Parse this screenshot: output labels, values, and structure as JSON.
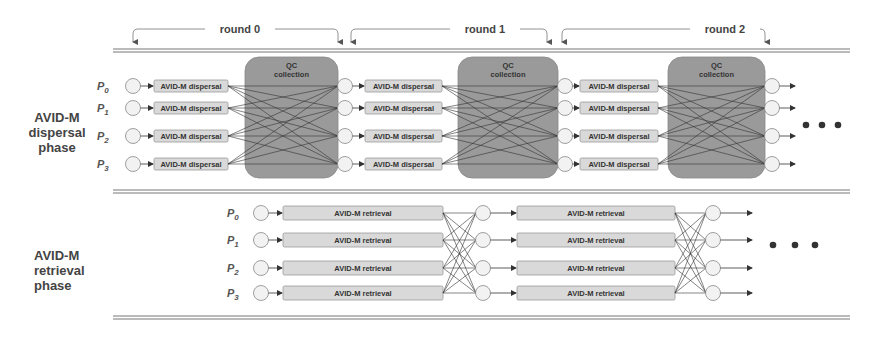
{
  "rounds": [
    {
      "label": "round 0"
    },
    {
      "label": "round 1"
    },
    {
      "label": "round 2"
    }
  ],
  "dispersal_phase": {
    "label_lines": [
      "AVID-M",
      "dispersal",
      "phase"
    ],
    "processes": [
      "P0",
      "P1",
      "P2",
      "P3"
    ],
    "process_subscripts": [
      "0",
      "1",
      "2",
      "3"
    ],
    "box_label": "AVID-M dispersal",
    "qc_label_lines": [
      "QC",
      "collection"
    ],
    "rounds_shown": 3
  },
  "retrieval_phase": {
    "label_lines": [
      "AVID-M",
      "retrieval",
      "phase"
    ],
    "processes": [
      "P0",
      "P1",
      "P2",
      "P3"
    ],
    "process_subscripts": [
      "0",
      "1",
      "2",
      "3"
    ],
    "box_label": "AVID-M retrieval",
    "stages_shown": 2
  },
  "continuation": "...",
  "colors": {
    "qc_box": "#9a9a9a",
    "task_box": "#d9d9d9",
    "circle": "#f2f2f2",
    "line": "#333333",
    "dots": "#333333"
  }
}
